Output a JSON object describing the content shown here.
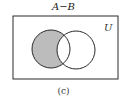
{
  "diagram": {
    "title": "A−B",
    "universe_label": "U",
    "caption": "(c)",
    "shaded_region": "A minus B",
    "colors": {
      "shade": "#bcbcbc",
      "stroke": "#2a2a2a",
      "background": "#ffffff"
    }
  }
}
